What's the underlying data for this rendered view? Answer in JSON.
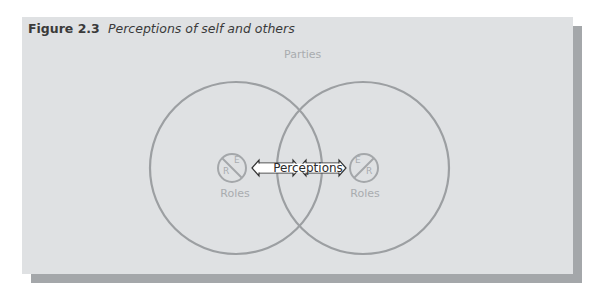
{
  "figure": {
    "number": "Figure 2.3",
    "caption": "Perceptions of self and others"
  },
  "diagram": {
    "outer_label": "Parties",
    "arrow_label": "Perceptions",
    "left_party": {
      "roles_label": "Roles",
      "top_letter": "E",
      "bottom_letter": "R"
    },
    "right_party": {
      "roles_label": "Roles",
      "top_letter": "E",
      "bottom_letter": "R"
    },
    "colors": {
      "panel_bg": "#dfe1e3",
      "shadow": "#a4a7aa",
      "circle_stroke": "#9c9fa2",
      "label_grey": "#a9acaf",
      "arrow_fill": "#ffffff",
      "arrow_stroke": "#333333"
    }
  }
}
